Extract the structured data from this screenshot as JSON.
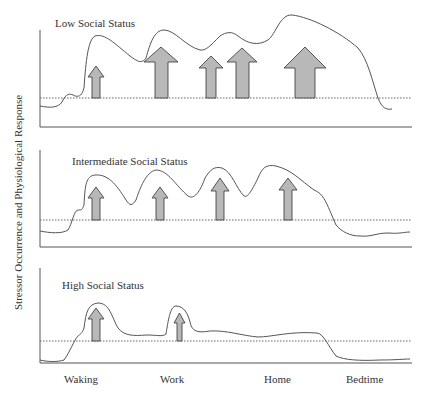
{
  "diagram": {
    "y_axis_label": "Stressor Occurrence and Physiological Response",
    "x_axis_labels": [
      "Waking",
      "Work",
      "Home",
      "Bedtime"
    ],
    "panels": [
      {
        "title": "Low Social Status",
        "stressor_arrows": 5,
        "arrow_sizes": [
          "small",
          "large",
          "small",
          "medium",
          "large"
        ]
      },
      {
        "title": "Intermediate Social Status",
        "stressor_arrows": 4,
        "arrow_sizes": [
          "small",
          "small",
          "small",
          "small"
        ]
      },
      {
        "title": "High Social Status",
        "stressor_arrows": 2,
        "arrow_sizes": [
          "small",
          "small"
        ]
      }
    ],
    "colors": {
      "curve": "#555555",
      "arrow_fill": "#b8b8b8",
      "arrow_stroke": "#333333",
      "axis": "#555555",
      "threshold_dotted": "#666666"
    }
  }
}
